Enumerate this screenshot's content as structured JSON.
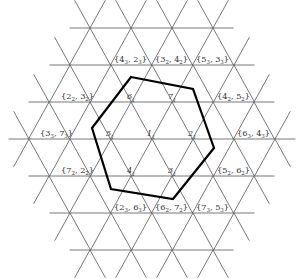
{
  "diagram": {
    "type": "triangular-lattice-with-hexagon",
    "colors": {
      "grid": "#555555",
      "hexagon": "#000000",
      "text": "#333333",
      "background": "#ffffff"
    },
    "lattice": {
      "edge": 41,
      "row_height": 37,
      "center": [
        152,
        139
      ],
      "rows": [
        {
          "y": 28,
          "x_start": 90,
          "count": 4
        },
        {
          "y": 65,
          "x_start": 70,
          "count": 5
        },
        {
          "y": 102,
          "x_start": 49,
          "count": 6
        },
        {
          "y": 139,
          "x_start": 29,
          "count": 7
        },
        {
          "y": 176,
          "x_start": 49,
          "count": 6
        },
        {
          "y": 213,
          "x_start": 70,
          "count": 5
        },
        {
          "y": 250,
          "x_start": 90,
          "count": 4
        }
      ]
    },
    "hexagon_vertices": [
      [
        131,
        77
      ],
      [
        193,
        89
      ],
      [
        214,
        148
      ],
      [
        173,
        199
      ],
      [
        111,
        189
      ],
      [
        92,
        128
      ]
    ],
    "inner_labels": [
      {
        "text": "1",
        "x": 150,
        "y": 136
      },
      {
        "text": "2",
        "x": 191,
        "y": 136
      },
      {
        "text": "3",
        "x": 171,
        "y": 173
      },
      {
        "text": "4",
        "x": 130,
        "y": 173
      },
      {
        "text": "5",
        "x": 109,
        "y": 136
      },
      {
        "text": "6",
        "x": 130,
        "y": 99
      },
      {
        "text": "7",
        "x": 171,
        "y": 99
      }
    ],
    "pair_labels": [
      {
        "a": "4",
        "as": "3",
        "b": "2",
        "bs": "3",
        "x": 114,
        "y": 62
      },
      {
        "a": "3",
        "as": "2",
        "b": "4",
        "bs": "2",
        "x": 155,
        "y": 62
      },
      {
        "a": "5",
        "as": "3",
        "b": "3",
        "bs": "3",
        "x": 196,
        "y": 62
      },
      {
        "a": "2",
        "as": "2",
        "b": "3",
        "bs": "2",
        "x": 61,
        "y": 99
      },
      {
        "a": "4",
        "as": "2",
        "b": "5",
        "bs": "2",
        "x": 217,
        "y": 99
      },
      {
        "a": "3",
        "as": "3",
        "b": "7",
        "bs": "3",
        "x": 40,
        "y": 136
      },
      {
        "a": "6",
        "as": "3",
        "b": "4",
        "bs": "3",
        "x": 237,
        "y": 136
      },
      {
        "a": "7",
        "as": "2",
        "b": "2",
        "bs": "2",
        "x": 61,
        "y": 173
      },
      {
        "a": "5",
        "as": "2",
        "b": "6",
        "bs": "2",
        "x": 217,
        "y": 173
      },
      {
        "a": "2",
        "as": "3",
        "b": "6",
        "bs": "3",
        "x": 114,
        "y": 210
      },
      {
        "a": "6",
        "as": "2",
        "b": "7",
        "bs": "2",
        "x": 155,
        "y": 210
      },
      {
        "a": "7",
        "as": "3",
        "b": "5",
        "bs": "3",
        "x": 196,
        "y": 210
      }
    ]
  }
}
